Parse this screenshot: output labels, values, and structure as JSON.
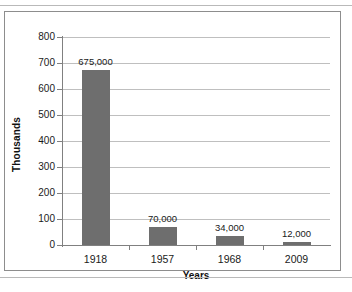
{
  "chart_data": {
    "type": "bar",
    "title": "",
    "xlabel": "Years",
    "ylabel": "Thousands",
    "categories": [
      "1918",
      "1957",
      "1968",
      "2009"
    ],
    "values": [
      675,
      70,
      34,
      12
    ],
    "data_labels": [
      "675,000",
      "70,000",
      "34,000",
      "12,000"
    ],
    "ylim": [
      0,
      800
    ],
    "y_ticks": [
      800,
      700,
      600,
      500,
      400,
      300,
      200,
      100,
      0
    ],
    "y_tick_labels": [
      "800",
      "700",
      "600",
      "500",
      "400",
      "300",
      "200",
      "100",
      "0"
    ],
    "grid": true,
    "legend": false,
    "series_color": "#6e6e6e",
    "gridline_color": "#bfbfbf",
    "axis_color": "#808080",
    "frame_color": "#8d8d8d"
  }
}
